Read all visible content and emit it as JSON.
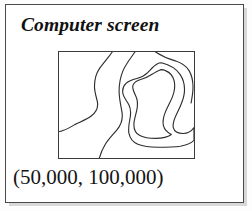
{
  "figure": {
    "panel": {
      "title": "Computer screen",
      "coordinate_label": "(50,000, 100,000)",
      "border_color": "#4a4a4a",
      "background_color": "#ffffff"
    },
    "map": {
      "border_color": "#3b3b3b",
      "line_color": "#2e2e2e",
      "feature_count": 5,
      "features": [
        {
          "name": "stream-line-left",
          "type": "open-curve",
          "description": "sinuous line from top edge down to left edge"
        },
        {
          "name": "stream-line-center",
          "type": "open-curve",
          "description": "sinuous line from top edge down to bottom edge"
        },
        {
          "name": "contour-outer-right",
          "type": "closed-contour",
          "description": "large irregular closed contour on right half"
        },
        {
          "name": "contour-inner-right",
          "type": "closed-contour",
          "description": "smaller closed contour nested inside outer contour"
        },
        {
          "name": "contour-edge-right",
          "type": "open-curve",
          "description": "curve along upper right entering from top and right edges"
        }
      ]
    }
  }
}
